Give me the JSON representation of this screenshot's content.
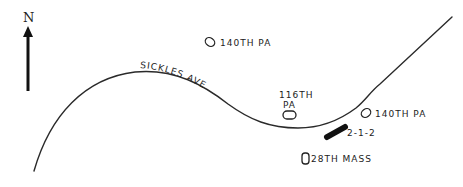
{
  "map": {
    "compass": {
      "label": "N",
      "icon": "north-arrow-icon"
    },
    "road": {
      "label": "SICKLES AVE"
    },
    "units": [
      {
        "id": "140th-pa-north",
        "label": "140TH PA",
        "icon": "unit-position-marker"
      },
      {
        "id": "116th-pa",
        "label_line1": "116TH",
        "label_line2": "PA",
        "icon": "unit-position-marker"
      },
      {
        "id": "140th-pa-east",
        "label": "140TH PA",
        "icon": "unit-position-marker"
      },
      {
        "id": "28th-mass",
        "label": "28TH MASS",
        "icon": "unit-position-marker"
      }
    ],
    "highlight": {
      "label": "2-1-2",
      "icon": "position-bar-marker",
      "color": "#111111"
    },
    "colors": {
      "ink": "#222222",
      "background": "#ffffff"
    }
  }
}
